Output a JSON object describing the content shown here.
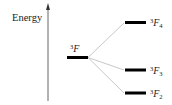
{
  "diagram": {
    "axis": {
      "label": "Energy"
    },
    "parent_level": {
      "sup": "3",
      "term": "F",
      "sub": ""
    },
    "levels": [
      {
        "sup": "3",
        "term": "F",
        "sub": "4"
      },
      {
        "sup": "3",
        "term": "F",
        "sub": "3"
      },
      {
        "sup": "3",
        "term": "F",
        "sub": "2"
      }
    ],
    "colors": {
      "bar": "#000000",
      "axis": "#555555",
      "connector": "#c8c8c8",
      "text": "#222222"
    }
  }
}
